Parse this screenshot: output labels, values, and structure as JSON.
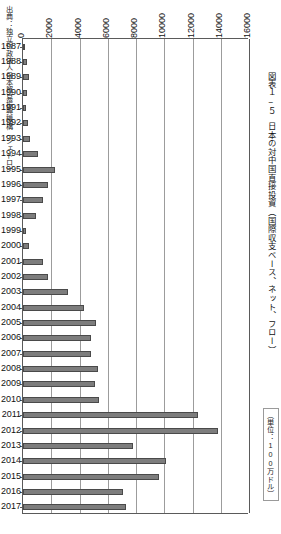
{
  "source_note": "出典：独立行政法人日本貿易振興機構（ジェトロ）",
  "title": {
    "figure_number": "図表１−５",
    "text": "日本の対中国直接投資（国際収支ベース、ネット、フロー）"
  },
  "unit_note": "（単位：100万ドル）",
  "colors": {
    "bar_fill": "#7d7d7d",
    "bar_border": "#4a4a4a",
    "gridline": "#9c9c9c",
    "axis": "#5a5a5a",
    "text": "#111111",
    "background": "#ffffff"
  },
  "chart_data": {
    "type": "bar",
    "orientation": "horizontal",
    "subtitle": "（単位：100万ドル）",
    "xlabel": "",
    "ylabel": "",
    "xlim": [
      0,
      16000
    ],
    "grid": true,
    "legend": false,
    "source": "出典：独立行政法人日本貿易振興機構（ジェトロ）",
    "xticks": [
      0,
      2000,
      4000,
      6000,
      8000,
      10000,
      12000,
      14000,
      16000
    ],
    "xtick_labels": [
      "0",
      "2000",
      "4000",
      "6000",
      "8000",
      "10000",
      "12000",
      "14000",
      "16000"
    ],
    "categories": [
      "1987",
      "1988",
      "1989",
      "1990",
      "1991",
      "1992",
      "1993",
      "1994",
      "1995",
      "1996",
      "1997",
      "1998",
      "1999",
      "2000",
      "2001",
      "2002",
      "2003",
      "2004",
      "2005",
      "2006",
      "2007",
      "2008",
      "2009",
      "2010",
      "2011",
      "2012",
      "2013",
      "2014",
      "2015",
      "2016",
      "2017"
    ],
    "values": [
      120,
      300,
      440,
      260,
      190,
      320,
      520,
      1050,
      2300,
      1750,
      1420,
      900,
      220,
      420,
      1450,
      1800,
      3200,
      4300,
      5200,
      4800,
      4800,
      5300,
      5100,
      5400,
      12400,
      13800,
      7800,
      10100,
      9600,
      7100,
      7300
    ],
    "value_unit": "million USD",
    "annotations": []
  }
}
